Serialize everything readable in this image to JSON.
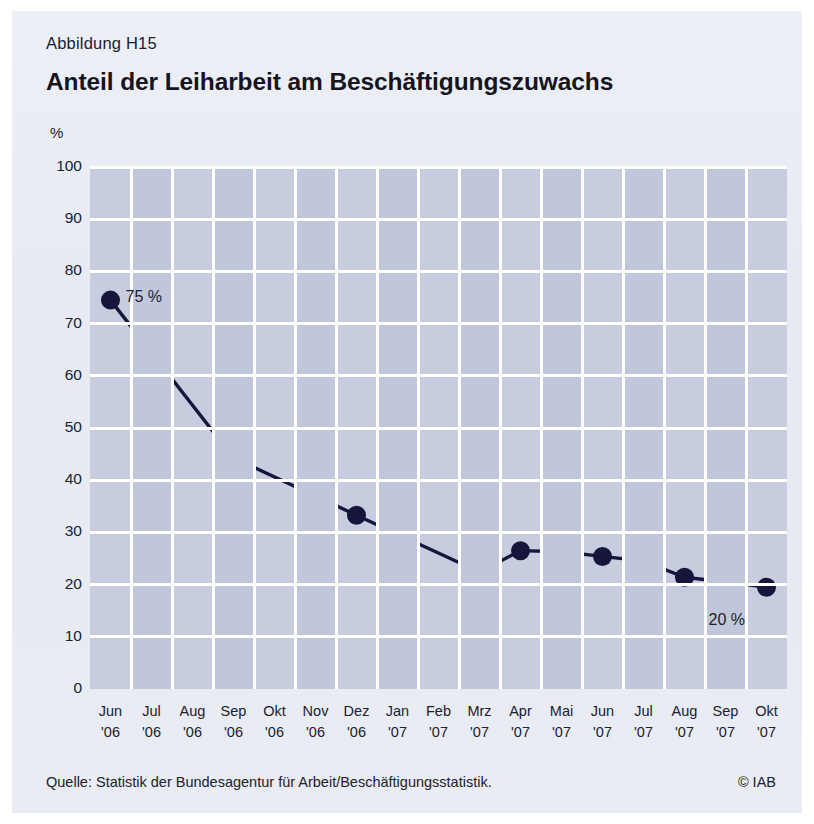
{
  "figure": {
    "number": "Abbildung H15",
    "title": "Anteil der Leiharbeit am Beschäftigungszuwachs",
    "unit": "%",
    "source": "Quelle: Statistik der Bundesagentur für Arbeit/Beschäftigungsstatistik.",
    "copyright": "© IAB"
  },
  "colors": {
    "page_background": "#ffffff",
    "card_background": "#e8ebf3",
    "plot_background": "#c7ccde",
    "plot_band": "#c1c7db",
    "gridline": "#ffffff",
    "series_line": "#16163c",
    "marker": "#16163c",
    "text": "#21212b"
  },
  "chart_data": {
    "type": "line",
    "title": "Anteil der Leiharbeit am Beschäftigungszuwachs",
    "subtitle": "Abbildung H15",
    "xlabel": "",
    "ylabel": "%",
    "ylim": [
      0,
      100
    ],
    "yticks": [
      0,
      10,
      20,
      30,
      40,
      50,
      60,
      70,
      80,
      90,
      100
    ],
    "ytick_labels": [
      "0",
      "10",
      "20",
      "30",
      "40",
      "50",
      "60",
      "70",
      "80",
      "90",
      "100"
    ],
    "grid": true,
    "legend": "none",
    "categories": [
      "Jun '06",
      "Jul '06",
      "Aug '06",
      "Sep '06",
      "Okt '06",
      "Nov '06",
      "Dez '06",
      "Jan '07",
      "Feb '07",
      "Mrz '07",
      "Apr '07",
      "Mai '07",
      "Jun '07",
      "Jul '07",
      "Aug '07",
      "Sep '07",
      "Okt '07"
    ],
    "xtick_months": [
      "Jun",
      "Jul",
      "Aug",
      "Sep",
      "Okt",
      "Nov",
      "Dez",
      "Jan",
      "Feb",
      "Mrz",
      "Apr",
      "Mai",
      "Jun",
      "Jul",
      "Aug",
      "Sep",
      "Okt"
    ],
    "xtick_years": [
      "'06",
      "'06",
      "'06",
      "'06",
      "'06",
      "'06",
      "'06",
      "'07",
      "'07",
      "'07",
      "'07",
      "'07",
      "'07",
      "'07",
      "'07",
      "'07",
      "'07"
    ],
    "series": [
      {
        "name": "Anteil der Leiharbeit am Beschäftigungszuwachs",
        "values": [
          74.5,
          null,
          null,
          44.3,
          null,
          null,
          33.3,
          null,
          null,
          22.4,
          26.5,
          26.3,
          25.4,
          24.5,
          21.4,
          20.5,
          19.5
        ],
        "marker_indices": [
          0,
          3,
          6,
          9,
          10,
          11,
          12,
          13,
          14,
          15,
          16
        ]
      }
    ],
    "annotations": [
      {
        "text": "75 %",
        "category": "Jun '06",
        "value": 74.5,
        "position": "right"
      },
      {
        "text": "20 %",
        "category": "Okt '07",
        "value": 19.5,
        "position": "below-left"
      }
    ]
  }
}
